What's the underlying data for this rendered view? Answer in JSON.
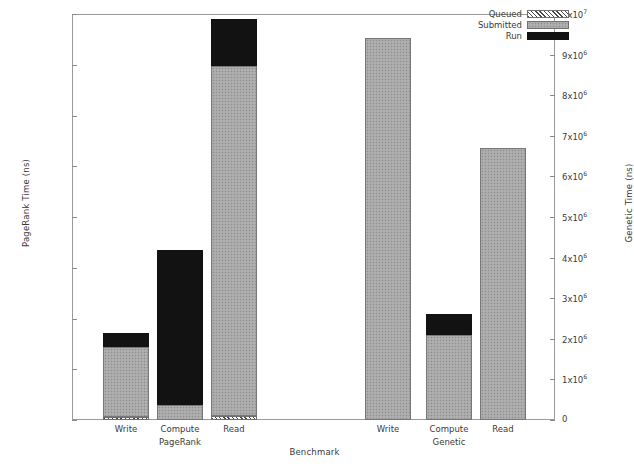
{
  "chart_data": {
    "type": "bar",
    "subtype": "stacked-grouped-dual-axis",
    "title": "",
    "xlabel": "Benchmark",
    "ylabel": "PageRank Time (ns)",
    "y2label": "Genetic Time (ns)",
    "ylim": [
      0,
      4000
    ],
    "y2lim": [
      0,
      10000000
    ],
    "grid": false,
    "legend_position": "top-right",
    "categories": [
      "Write",
      "Compute",
      "Read",
      "Write",
      "Compute",
      "Read"
    ],
    "groups": [
      {
        "name": "PageRank",
        "categories": [
          "Write",
          "Compute",
          "Read"
        ],
        "axis": "left"
      },
      {
        "name": "Genetic",
        "categories": [
          "Write",
          "Compute",
          "Read"
        ],
        "axis": "right"
      }
    ],
    "series": [
      {
        "name": "Queued",
        "values": [
          30,
          0,
          40,
          0,
          0,
          0
        ]
      },
      {
        "name": "Submitted",
        "values": [
          690,
          150,
          3450,
          9400000,
          2090000,
          6700000
        ]
      },
      {
        "name": "Run",
        "values": [
          135,
          1525,
          460,
          0,
          510000,
          0
        ]
      }
    ],
    "left_ticks": [
      "0",
      "500",
      "1000",
      "1500",
      "2000",
      "2500",
      "3000",
      "3500",
      "4000"
    ],
    "left_tick_values": [
      0,
      500,
      1000,
      1500,
      2000,
      2500,
      3000,
      3500,
      4000
    ],
    "right_ticks": [
      "0",
      "1x10^6",
      "2x10^6",
      "3x10^6",
      "4x10^6",
      "5x10^6",
      "6x10^6",
      "7x10^6",
      "8x10^6",
      "9x10^6",
      "1x10^7"
    ],
    "right_tick_values": [
      0,
      1000000,
      2000000,
      3000000,
      4000000,
      5000000,
      6000000,
      7000000,
      8000000,
      9000000,
      10000000
    ],
    "bars": [
      {
        "group": "PageRank",
        "category": "Write",
        "axis": "left",
        "total": 855,
        "segments": [
          {
            "series": "Queued",
            "value": 30
          },
          {
            "series": "Submitted",
            "value": 690
          },
          {
            "series": "Run",
            "value": 135
          }
        ]
      },
      {
        "group": "PageRank",
        "category": "Compute",
        "axis": "left",
        "total": 1675,
        "segments": [
          {
            "series": "Queued",
            "value": 0
          },
          {
            "series": "Submitted",
            "value": 150
          },
          {
            "series": "Run",
            "value": 1525
          }
        ]
      },
      {
        "group": "PageRank",
        "category": "Read",
        "axis": "left",
        "total": 3950,
        "segments": [
          {
            "series": "Queued",
            "value": 40
          },
          {
            "series": "Submitted",
            "value": 3450
          },
          {
            "series": "Run",
            "value": 460
          }
        ]
      },
      {
        "group": "Genetic",
        "category": "Write",
        "axis": "right",
        "total": 9400000,
        "segments": [
          {
            "series": "Queued",
            "value": 0
          },
          {
            "series": "Submitted",
            "value": 9400000
          },
          {
            "series": "Run",
            "value": 0
          }
        ]
      },
      {
        "group": "Genetic",
        "category": "Compute",
        "axis": "right",
        "total": 2600000,
        "segments": [
          {
            "series": "Queued",
            "value": 0
          },
          {
            "series": "Submitted",
            "value": 2090000
          },
          {
            "series": "Run",
            "value": 510000
          }
        ]
      },
      {
        "group": "Genetic",
        "category": "Read",
        "axis": "right",
        "total": 6700000,
        "segments": [
          {
            "series": "Queued",
            "value": 0
          },
          {
            "series": "Submitted",
            "value": 6700000
          },
          {
            "series": "Run",
            "value": 0
          }
        ]
      }
    ],
    "colors": {
      "run": "#121212",
      "submitted": "#a8a8a8",
      "queued": "#d9d9d9",
      "axis": "#8a8a8a",
      "text": "#3a3a3a"
    }
  },
  "legend": {
    "items": [
      {
        "label": "Queued",
        "pattern": "queued"
      },
      {
        "label": "Submitted",
        "pattern": "submitted"
      },
      {
        "label": "Run",
        "pattern": "run"
      }
    ]
  }
}
